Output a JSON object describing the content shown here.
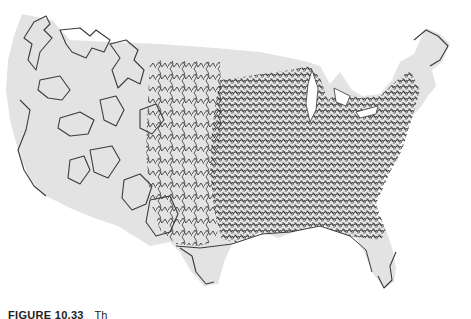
{
  "figure": {
    "label": "FIGURE 10.33",
    "caption_text": "Th",
    "map_fill": "#e3e3e3",
    "tour_stroke": "#3a3a3a"
  }
}
